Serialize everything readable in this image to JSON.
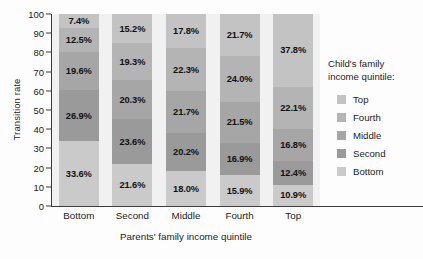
{
  "chart_data": {
    "type": "bar",
    "title": "",
    "subtitle": "",
    "xlabel": "Parents' family income quintile",
    "ylabel": "Transition rate",
    "stacked": true,
    "stack_total": 100,
    "ylim": [
      0,
      100
    ],
    "yticks": [
      0,
      10,
      20,
      30,
      40,
      50,
      60,
      70,
      80,
      90,
      100
    ],
    "ytick_labels": [
      "0",
      "10",
      "20",
      "30",
      "40",
      "50",
      "60",
      "70",
      "80",
      "90",
      "100"
    ],
    "grid": false,
    "legend_position": "right",
    "legend_title": "Child's family income quintile:",
    "legend_title_lines": [
      "Child's family",
      "income quintile:"
    ],
    "categories": [
      "Bottom",
      "Second",
      "Middle",
      "Fourth",
      "Top"
    ],
    "series": [
      {
        "name": "Top",
        "color": "#c3c3c3",
        "values": [
          7.4,
          15.2,
          17.8,
          21.7,
          37.8
        ],
        "labels": [
          "7.4%",
          "15.2%",
          "17.8%",
          "21.7%",
          "37.8%"
        ]
      },
      {
        "name": "Fourth",
        "color": "#b4b4b4",
        "values": [
          12.5,
          19.3,
          22.3,
          24.0,
          22.1
        ],
        "labels": [
          "12.5%",
          "19.3%",
          "22.3%",
          "24.0%",
          "22.1%"
        ]
      },
      {
        "name": "Middle",
        "color": "#a6a6a6",
        "values": [
          19.6,
          20.3,
          21.7,
          21.5,
          16.8
        ],
        "labels": [
          "19.6%",
          "20.3%",
          "21.7%",
          "21.5%",
          "16.8%"
        ]
      },
      {
        "name": "Second",
        "color": "#9a9a9a",
        "values": [
          26.9,
          23.6,
          20.2,
          16.9,
          12.4
        ],
        "labels": [
          "26.9%",
          "23.6%",
          "20.2%",
          "16.9%",
          "12.4%"
        ]
      },
      {
        "name": "Bottom",
        "color": "#cacaca",
        "values": [
          33.6,
          21.6,
          18.0,
          15.9,
          10.9
        ],
        "labels": [
          "33.6%",
          "21.6%",
          "18.0%",
          "15.9%",
          "10.9%"
        ]
      }
    ],
    "legend_entries": [
      {
        "label": "Top",
        "color": "#c3c3c3"
      },
      {
        "label": "Fourth",
        "color": "#b4b4b4"
      },
      {
        "label": "Middle",
        "color": "#a6a6a6"
      },
      {
        "label": "Second",
        "color": "#9a9a9a"
      },
      {
        "label": "Bottom",
        "color": "#cacaca"
      }
    ]
  }
}
